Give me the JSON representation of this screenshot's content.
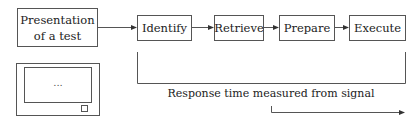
{
  "diagram": {
    "stimulus": {
      "line1": "Presentation",
      "line2": "of a test"
    },
    "steps": [
      {
        "label": "Identify"
      },
      {
        "label": "Retrieve"
      },
      {
        "label": "Prepare"
      },
      {
        "label": "Execute"
      }
    ],
    "monitor": {
      "screen_text": "..."
    },
    "bracket_caption": "Response time measured from signal",
    "colors": {
      "stroke": "#555555",
      "text": "#222222",
      "background": "#ffffff"
    }
  }
}
